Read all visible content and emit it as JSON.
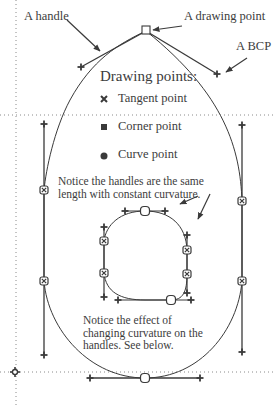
{
  "labels": {
    "handle": "A handle",
    "drawing_point": "A drawing point",
    "bcp": "A BCP"
  },
  "legend": {
    "title": "Drawing points:",
    "items": [
      {
        "symbol": "tangent",
        "label": "Tangent point"
      },
      {
        "symbol": "corner",
        "label": "Corner point"
      },
      {
        "symbol": "curve",
        "label": "Curve point"
      }
    ]
  },
  "notes": {
    "constant_curvature": "Notice the handles are the same length with constant curvature.",
    "changing_curvature": "Notice the effect of changing curvature on the handles. See below."
  },
  "colors": {
    "stroke": "#3a3a3a",
    "guide": "#8a8a8a",
    "background": "#ffffff"
  }
}
